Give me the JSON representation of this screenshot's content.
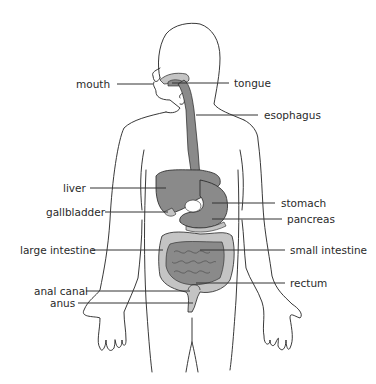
{
  "diagram": {
    "colors": {
      "outline": "#222222",
      "organ_dark": "#8a8a8a",
      "organ_light": "#c4c4c4",
      "leader_line": "#333333",
      "text": "#2a2a2a"
    },
    "labels": {
      "mouth": "mouth",
      "tongue": "tongue",
      "esophagus": "esophagus",
      "liver": "liver",
      "gallbladder": "gallbladder",
      "stomach": "stomach",
      "pancreas": "pancreas",
      "large_intestine": "large intestine",
      "small_intestine": "small intestine",
      "rectum": "rectum",
      "anal_canal": "anal canal",
      "anus": "anus"
    }
  }
}
